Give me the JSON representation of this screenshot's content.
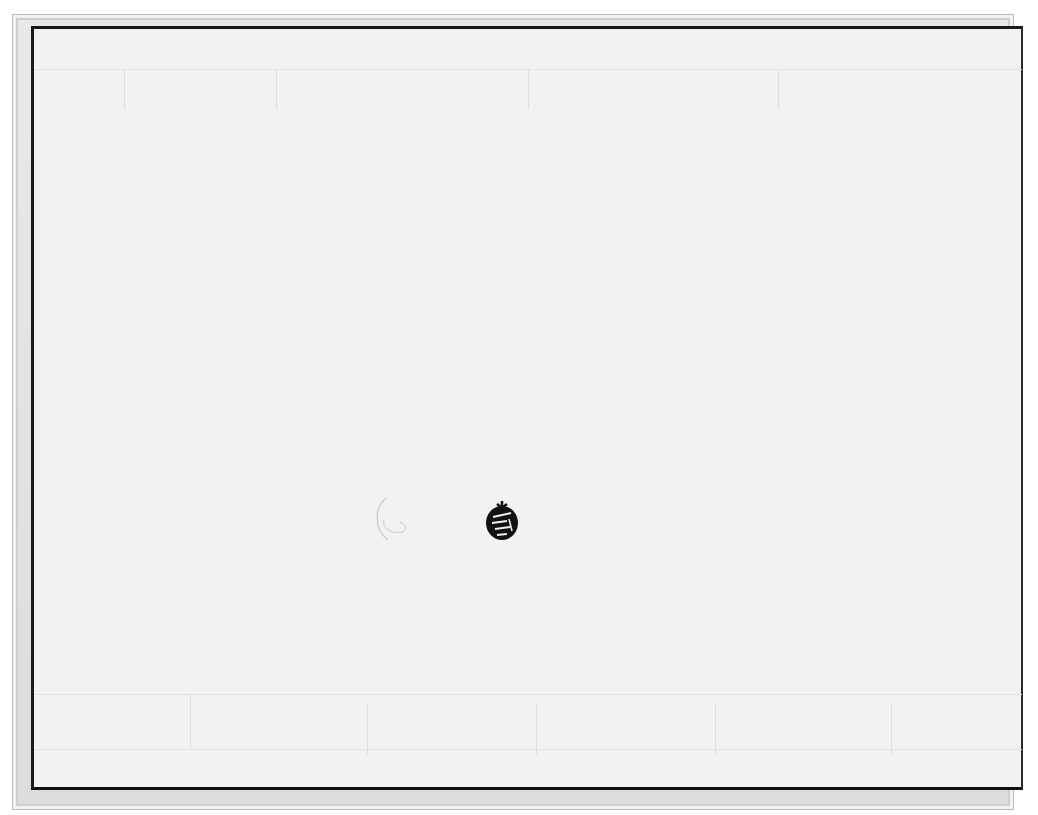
{
  "scene": {
    "description": "Photograph of a blank framed light-grey panel with a small dark ornamental emblem near the center",
    "colors": {
      "frame": "#dcdcdc",
      "panel": "#f2f2f2",
      "panel_border": "#1a1a1a",
      "emblem": "#111111"
    }
  }
}
